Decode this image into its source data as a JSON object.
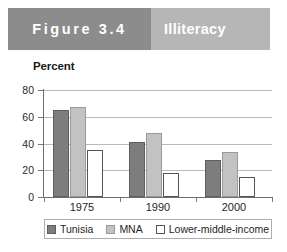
{
  "banner": {
    "figure_label": "Figure 3.4",
    "title": "Illiteracy",
    "left_color": "#8c8c8c",
    "right_color": "#b6b6b6",
    "text_color": "#ffffff"
  },
  "legend": {
    "position": "bottom",
    "items": [
      {
        "label": "Tunisia",
        "color": "#7d7d7d",
        "swatch": "tunisia"
      },
      {
        "label": "MNA",
        "color": "#c2c2c2",
        "swatch": "mna"
      },
      {
        "label": "Lower-middle-income",
        "color": "#ffffff",
        "swatch": "lmi"
      }
    ]
  },
  "chart_data": {
    "type": "bar",
    "title": "Illiteracy",
    "xlabel": "",
    "ylabel": "Percent",
    "ylim": [
      0,
      80
    ],
    "yticks": [
      0,
      20,
      40,
      60,
      80
    ],
    "ytick_labels": [
      "0",
      "20",
      "40",
      "60",
      "80"
    ],
    "grid": true,
    "categories": [
      "1975",
      "1990",
      "2000"
    ],
    "series": [
      {
        "name": "Tunisia",
        "color": "#7d7d7d",
        "values": [
          65,
          41,
          28
        ]
      },
      {
        "name": "MNA",
        "color": "#c2c2c2",
        "values": [
          67,
          48,
          34
        ]
      },
      {
        "name": "Lower-middle-income",
        "color": "#ffffff",
        "values": [
          35,
          18,
          15
        ]
      }
    ]
  }
}
